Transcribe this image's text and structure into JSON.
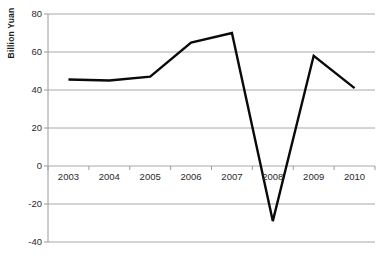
{
  "chart_data": {
    "type": "line",
    "title": "",
    "xlabel": "",
    "ylabel": "Billion Yuan",
    "categories": [
      "2003",
      "2004",
      "2005",
      "2006",
      "2007",
      "2008",
      "2009",
      "2010"
    ],
    "values": [
      45.5,
      45,
      47,
      65,
      70,
      -29,
      58,
      41
    ],
    "series": [
      {
        "name": "Billion Yuan",
        "values": [
          45.5,
          45,
          47,
          65,
          70,
          -29,
          58,
          41
        ]
      }
    ],
    "ylim": [
      -40,
      80
    ],
    "yticks": [
      80,
      60,
      40,
      20,
      0,
      -20,
      -40
    ],
    "ytick_labels": [
      "80",
      "60",
      "40",
      "20",
      "0",
      "-20",
      "-40"
    ],
    "grid": true,
    "legend": "none",
    "line_color": "#0a0a0a",
    "grid_color": "#a8a8a8",
    "axis_color": "#9a9a9a"
  }
}
